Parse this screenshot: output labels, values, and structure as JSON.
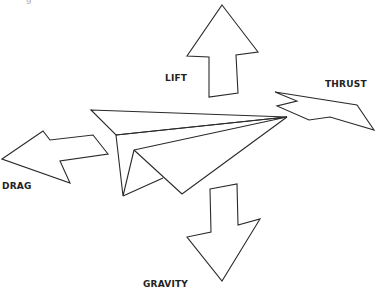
{
  "diagram": {
    "stroke_color": "#2a2a2a",
    "background": "#ffffff",
    "labels": {
      "lift": "LIFT",
      "thrust": "THRUST",
      "drag": "DRAG",
      "gravity": "GRAVITY"
    },
    "arrows": {
      "lift": {
        "direction": "up",
        "points": "222,5 258,52 236,55 238,93 209,97 209,57 187,56"
      },
      "thrust": {
        "direction": "right",
        "points": "275,92 357,105 374,130 330,117 309,120 277,106 297,101"
      },
      "drag": {
        "direction": "left",
        "points": "2,159 43,131 50,140 93,135 108,154 60,161 70,183"
      },
      "gravity": {
        "direction": "down",
        "points": "210,189 237,184 238,225 260,219 222,281 187,237 211,232"
      }
    },
    "plane": {
      "top_wing": "91,110 287,117 116,135",
      "body_fold": "116,135 287,117 134,150",
      "left_side": "116,135 123,196 134,150",
      "keel": "134,150 182,194 287,117",
      "inner_crease": "123,196 163,178"
    }
  }
}
